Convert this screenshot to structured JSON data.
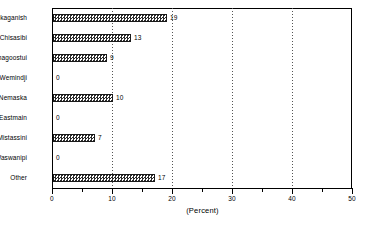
{
  "chart_data": {
    "type": "bar",
    "orientation": "horizontal",
    "title": "",
    "xlabel": "(Percent)",
    "ylabel": "",
    "xlim": [
      0,
      50
    ],
    "ylim": null,
    "grid": true,
    "gridlines_x": [
      10,
      20,
      30,
      40
    ],
    "legend": null,
    "xticks": [
      0,
      10,
      20,
      30,
      40,
      50
    ],
    "xtick_labels": [
      "0",
      "10",
      "20",
      "30",
      "40",
      "50"
    ],
    "xticks_minor": [
      5,
      15,
      25,
      35,
      45
    ],
    "categories": [
      "Waskaganish",
      "Chisasibi",
      "Whapmagoostui",
      "Wemindji",
      "Nemaska",
      "Eastmain",
      "Mistassini",
      "Waswanipi",
      "Other"
    ],
    "values": [
      19,
      13,
      9,
      0,
      10,
      0,
      7,
      0,
      17
    ],
    "value_labels": [
      "19",
      "13",
      "9",
      "0",
      "10",
      "0",
      "7",
      "0",
      "17"
    ],
    "bar_fill": "checkerboard-hatch",
    "bar_color": "#2b2b2b",
    "axis_color": "#000000",
    "background": "#ffffff"
  }
}
